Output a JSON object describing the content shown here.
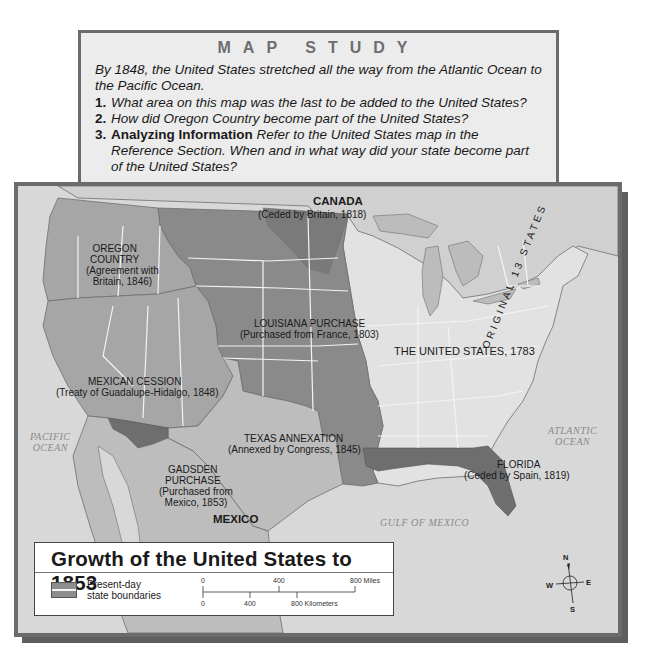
{
  "map_study": {
    "title": "MAP STUDY",
    "intro": "By 1848, the United States stretched all the way from the Atlantic Ocean to the Pacific Ocean.",
    "questions": [
      {
        "number": "1.",
        "lead": "",
        "text": "What area on this map was the last to be added to the United States?"
      },
      {
        "number": "2.",
        "lead": "",
        "text": "How did Oregon Country become part of the United States?"
      },
      {
        "number": "3.",
        "lead": "Analyzing Information",
        "text": " Refer to the United States map in the Reference Section. When and in what way did your state become part of the United States?"
      }
    ]
  },
  "map": {
    "title": "Growth of the United States to 1853",
    "regions": {
      "canada": "CANADA",
      "ceded_britain": "(Ceded by Britain, 1818)",
      "oregon_name": "OREGON\nCOUNTRY",
      "oregon_note": "(Agreement with\nBritain, 1846)",
      "louisiana_name": "LOUISIANA PURCHASE",
      "louisiana_note": "(Purchased from France, 1803)",
      "us1783": "THE UNITED STATES, 1783",
      "original13": "ORIGINAL 13 STATES",
      "mexican_name": "MEXICAN CESSION",
      "mexican_note": "(Treaty of Guadalupe-Hidalgo, 1848)",
      "texas_name": "TEXAS ANNEXATION",
      "texas_note": "(Annexed by Congress, 1845)",
      "gadsden_name": "GADSDEN\nPURCHASE",
      "gadsden_note": "(Purchased from\nMexico, 1853)",
      "florida_name": "FLORIDA",
      "florida_note": "(Ceded by Spain, 1819)",
      "mexico": "MEXICO"
    },
    "water": {
      "pacific": "PACIFIC\nOCEAN",
      "atlantic": "ATLANTIC\nOCEAN",
      "gulf": "GULF OF MEXICO"
    },
    "legend": {
      "swatch_label": "Present-day\nstate boundaries",
      "scale_miles": [
        "0",
        "400",
        "800 Miles"
      ],
      "scale_km": [
        "0",
        "400",
        "800 Kilometers"
      ]
    },
    "compass": {
      "n": "N",
      "s": "S",
      "e": "E",
      "w": "W"
    },
    "colors": {
      "us1783": "#e2e2e2",
      "louisiana": "#8a8a8a",
      "oregon_mexican": "#a6a6a6",
      "texas": "#bdbdbd",
      "florida_gadsden": "#6e6e6e",
      "water": "#d8d8d8",
      "frame": "#6b6b6b"
    }
  }
}
